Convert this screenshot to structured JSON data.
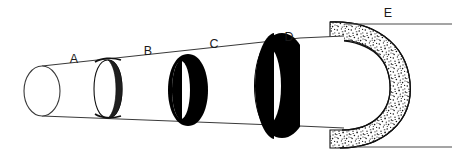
{
  "figure": {
    "background_color": "#ffffff",
    "ink_color": "#000000",
    "line_color": "#3a3a3a",
    "width": 452,
    "height": 157
  },
  "labels": [
    {
      "id": "A",
      "text": "A",
      "x": 74,
      "y": 63,
      "describes": "bare-cylinder-shaft"
    },
    {
      "id": "B",
      "text": "B",
      "x": 148,
      "y": 55,
      "describes": "thin-outline-ring"
    },
    {
      "id": "C",
      "text": "C",
      "x": 214,
      "y": 48,
      "describes": "medium-black-ring"
    },
    {
      "id": "D",
      "text": "D",
      "x": 289,
      "y": 41,
      "describes": "thick-black-ring"
    },
    {
      "id": "E",
      "text": "E",
      "x": 388,
      "y": 17,
      "describes": "stippled-bulb-ring"
    }
  ],
  "leader_lines": [
    {
      "id": "E-top",
      "x1": 345,
      "y1": 24,
      "x2": 452,
      "y2": 24
    },
    {
      "id": "E-bottom",
      "x1": 356,
      "y1": 147,
      "x2": 452,
      "y2": 147
    }
  ],
  "parts": [
    {
      "id": "shaft",
      "name": "cylinder-shaft",
      "fill": "#ffffff",
      "stroke": "#3a3a3a",
      "note": "tapered tube, open elliptical face at left"
    },
    {
      "id": "band-b",
      "name": "thin-outline-ring",
      "fill": "#ffffff",
      "stroke": "#111111",
      "thickness": "thin"
    },
    {
      "id": "band-c",
      "name": "medium-black-ring",
      "fill": "#000000",
      "stroke": "#000000",
      "thickness": "medium"
    },
    {
      "id": "band-d",
      "name": "thick-black-ring",
      "fill": "#000000",
      "stroke": "#000000",
      "thickness": "thick"
    },
    {
      "id": "bulb-e",
      "name": "stippled-bulb-ring",
      "fill": "#ffffff",
      "stipple": "#1a1a1a",
      "stroke": "#111111",
      "thickness": "very-thick"
    }
  ]
}
